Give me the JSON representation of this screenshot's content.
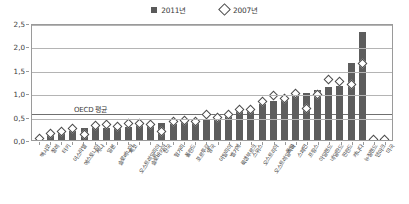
{
  "legend": {
    "items": [
      {
        "label": "2011년",
        "marker": "filled-square-icon",
        "color": "#5d5d5d"
      },
      {
        "label": "2007년",
        "marker": "open-diamond-icon",
        "color": "#ffffff"
      }
    ]
  },
  "annotation": {
    "oecd_average_label": "OECD 평균",
    "oecd_average_value": 0.6
  },
  "axis": {
    "y_ticks": [
      "0,0",
      "0,5",
      "1,0",
      "1,5",
      "2,0",
      "2,5"
    ],
    "y_min": 0.0,
    "y_max": 2.5,
    "y_step": 0.5
  },
  "chart_data": {
    "type": "bar",
    "title": "",
    "subtitle": "",
    "xlabel": "",
    "ylabel": "",
    "ylim": [
      0.0,
      2.5
    ],
    "grid": true,
    "legend_position": "top-center",
    "annotations": [
      {
        "text": "OECD 평균",
        "type": "reference-line",
        "y": 0.6
      }
    ],
    "categories": [
      "멕시코",
      "칠레",
      "터키",
      "이스라엘",
      "에스토니아",
      "케냐",
      "일본",
      "슬로베니아",
      "체코",
      "오스트레일리아",
      "슬로바키아",
      "한국",
      "헝가리",
      "폴란드",
      "포르투갈",
      "영국",
      "이탈리아",
      "벨기에",
      "룩셈부르크",
      "스위스",
      "오스트리아",
      "오스트레일리아",
      "독일",
      "스페인",
      "프랑스",
      "아일랜드",
      "네덜란드",
      "핀란드",
      "캐나다",
      "뉴질랜드",
      "덴마크",
      "미국"
    ],
    "series": [
      {
        "name": "2011년",
        "marker": "bar",
        "values": [
          0.02,
          0.11,
          0.14,
          0.2,
          0.25,
          0.27,
          0.26,
          0.3,
          0.27,
          0.32,
          0.3,
          0.36,
          0.34,
          0.38,
          0.39,
          0.44,
          0.45,
          0.55,
          0.64,
          0.62,
          0.78,
          0.84,
          0.92,
          0.97,
          1.01,
          1.06,
          1.13,
          1.16,
          1.65,
          2.3,
          0.0,
          0.0
        ]
      },
      {
        "name": "2007년",
        "marker": "diamond",
        "values": [
          0.02,
          0.12,
          0.16,
          0.22,
          0.09,
          0.29,
          0.31,
          0.26,
          0.34,
          0.33,
          0.31,
          0.15,
          0.38,
          0.39,
          0.38,
          0.52,
          0.47,
          0.52,
          0.63,
          0.62,
          0.8,
          0.93,
          0.87,
          0.97,
          0.66,
          0.95,
          1.27,
          1.22,
          1.17,
          1.62,
          0.0,
          0.0
        ]
      }
    ]
  }
}
